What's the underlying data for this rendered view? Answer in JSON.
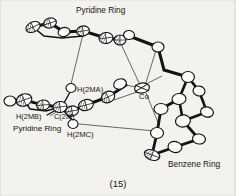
{
  "figure": {
    "caption": "(15)",
    "kind": "ortep-crystal-structure",
    "background_color": "#f4f2ee",
    "ink_color": "#131313"
  },
  "labels": {
    "pyridine_top": "Pyridine Ring",
    "pyridine_left": "Pyridine Ring",
    "benzene": "Benzene Ring",
    "metal": "Co",
    "h2ma": "H(2MA)",
    "h2mb": "H(2MB)",
    "c2m": "C(2M)",
    "h2mc": "H(2MC)"
  },
  "structure": {
    "metal_center": {
      "element": "Co",
      "x": 142,
      "y": 88
    },
    "atoms": [
      {
        "id": "a1",
        "x": 33,
        "y": 27,
        "rx": 7.5,
        "ry": 5.0,
        "rot": -25,
        "hatched": true
      },
      {
        "id": "a2",
        "x": 50,
        "y": 23,
        "rx": 6.5,
        "ry": 5.0,
        "rot": -18,
        "hatched": true
      },
      {
        "id": "a3",
        "x": 64,
        "y": 32,
        "rx": 6.0,
        "ry": 4.5,
        "rot": -12,
        "hatched": false
      },
      {
        "id": "a4",
        "x": 83,
        "y": 31,
        "rx": 6.5,
        "ry": 5.0,
        "rot": -10,
        "hatched": true
      },
      {
        "id": "a5",
        "x": 106,
        "y": 38,
        "rx": 7.0,
        "ry": 5.5,
        "rot": -8,
        "hatched": true
      },
      {
        "id": "a6",
        "x": 120,
        "y": 40,
        "rx": 6.0,
        "ry": 5.0,
        "rot": 0,
        "hatched": true
      },
      {
        "id": "a7",
        "x": 129,
        "y": 35,
        "rx": 5.5,
        "ry": 4.5,
        "rot": 5,
        "hatched": false
      },
      {
        "id": "a8",
        "x": 158,
        "y": 47,
        "rx": 6.0,
        "ry": 5.0,
        "rot": 0,
        "hatched": false
      },
      {
        "id": "a9",
        "x": 188,
        "y": 77,
        "rx": 6.5,
        "ry": 5.5,
        "rot": 0,
        "hatched": false
      },
      {
        "id": "a10",
        "x": 199,
        "y": 91,
        "rx": 6.0,
        "ry": 5.0,
        "rot": 10,
        "hatched": false
      },
      {
        "id": "a11",
        "x": 179,
        "y": 99,
        "rx": 7.0,
        "ry": 5.5,
        "rot": -5,
        "hatched": false
      },
      {
        "id": "a12",
        "x": 207,
        "y": 112,
        "rx": 6.5,
        "ry": 5.0,
        "rot": 15,
        "hatched": false
      },
      {
        "id": "a13",
        "x": 183,
        "y": 121,
        "rx": 7.5,
        "ry": 6.0,
        "rot": -10,
        "hatched": false
      },
      {
        "id": "a14",
        "x": 161,
        "y": 109,
        "rx": 7.0,
        "ry": 5.5,
        "rot": 0,
        "hatched": false
      },
      {
        "id": "a15",
        "x": 157,
        "y": 133,
        "rx": 6.5,
        "ry": 5.5,
        "rot": 0,
        "hatched": false
      },
      {
        "id": "a16",
        "x": 175,
        "y": 147,
        "rx": 7.0,
        "ry": 5.5,
        "rot": 10,
        "hatched": false
      },
      {
        "id": "a17",
        "x": 199,
        "y": 139,
        "rx": 6.5,
        "ry": 5.0,
        "rot": 8,
        "hatched": false
      },
      {
        "id": "a18",
        "x": 152,
        "y": 155,
        "rx": 8.0,
        "ry": 5.0,
        "rot": 20,
        "hatched": true
      },
      {
        "id": "a19",
        "x": 120,
        "y": 84,
        "rx": 6.5,
        "ry": 5.0,
        "rot": -20,
        "hatched": false
      },
      {
        "id": "a20",
        "x": 108,
        "y": 97,
        "rx": 7.0,
        "ry": 5.5,
        "rot": -25,
        "hatched": true
      },
      {
        "id": "a21",
        "x": 86,
        "y": 105,
        "rx": 7.5,
        "ry": 5.5,
        "rot": -15,
        "hatched": true
      },
      {
        "id": "a22",
        "x": 72,
        "y": 111,
        "rx": 6.5,
        "ry": 5.0,
        "rot": -10,
        "hatched": true
      },
      {
        "id": "a23",
        "x": 60,
        "y": 107,
        "rx": 7.0,
        "ry": 5.5,
        "rot": -8,
        "hatched": true
      },
      {
        "id": "a24",
        "x": 43,
        "y": 105,
        "rx": 6.5,
        "ry": 5.0,
        "rot": -5,
        "hatched": true
      },
      {
        "id": "a25",
        "x": 24,
        "y": 100,
        "rx": 8.0,
        "ry": 6.0,
        "rot": -20,
        "hatched": true
      },
      {
        "id": "a26",
        "x": 10,
        "y": 101,
        "rx": 6.0,
        "ry": 5.0,
        "rot": 0,
        "hatched": false
      },
      {
        "id": "h_a",
        "x": 71,
        "y": 88,
        "rx": 5.0,
        "ry": 4.5,
        "rot": 0,
        "hatched": false
      },
      {
        "id": "h_c",
        "x": 73,
        "y": 124,
        "rx": 5.0,
        "ry": 4.5,
        "rot": 0,
        "hatched": false
      }
    ],
    "contacts": [
      {
        "from": "ring-top",
        "to": "H(2MA)"
      },
      {
        "from": "H(2MC)",
        "to": "benzene-ring"
      },
      {
        "from": "Co",
        "to": "pyridine-top"
      },
      {
        "from": "Co",
        "to": "benzene-ring"
      }
    ]
  }
}
